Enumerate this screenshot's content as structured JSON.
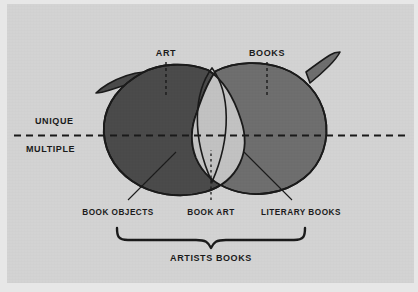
{
  "figure": {
    "kind": "venn-diagram",
    "background_color": "#d3d3d3",
    "outline_color": "#1a1a1a",
    "text_color": "#1a1a1a"
  },
  "sets": [
    {
      "id": "art",
      "label": "ART",
      "fill_color": "#4a4a4a",
      "side": "left",
      "leader": "dashed-vertical"
    },
    {
      "id": "books",
      "label": "BOOKS",
      "fill_color": "#6e6e6e",
      "side": "right",
      "leader": "dashed-vertical"
    }
  ],
  "intersection": {
    "id": "book-art-region",
    "fill_color": "#c2c2c2"
  },
  "axis": {
    "upper_label": "UNIQUE",
    "lower_label": "MULTIPLE",
    "line_style": "dashed",
    "orientation": "horizontal"
  },
  "regions": [
    {
      "id": "book-objects",
      "label": "BOOK OBJECTS",
      "leader": "diagonal"
    },
    {
      "id": "book-art",
      "label": "BOOK ART",
      "leader": "dotted-vertical"
    },
    {
      "id": "literary-books",
      "label": "LITERARY BOOKS",
      "leader": "diagonal"
    }
  ],
  "brace": {
    "label": "ARTISTS BOOKS",
    "spans": [
      "book-objects",
      "book-art",
      "literary-books"
    ]
  }
}
